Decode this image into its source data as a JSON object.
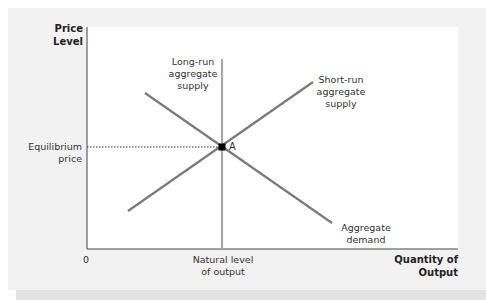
{
  "axes": {
    "y_label_line1": "Price",
    "y_label_line2": "Level",
    "x_label_line1": "Quantity of",
    "x_label_line2": "Output",
    "origin": "0"
  },
  "curves": {
    "lras_line1": "Long-run",
    "lras_line2": "aggregate",
    "lras_line3": "supply",
    "sras_line1": "Short-run",
    "sras_line2": "aggregate",
    "sras_line3": "supply",
    "ad_line1": "Aggregate",
    "ad_line2": "demand"
  },
  "annotations": {
    "equilibrium_line1": "Equilibrium",
    "equilibrium_line2": "price",
    "natural_line1": "Natural level",
    "natural_line2": "of output",
    "point_label": "A"
  },
  "colors": {
    "curve": "#7a7a7a",
    "lras": "#a8a8a8",
    "axis": "#444444",
    "panel": "#f2f2f2",
    "point": "#000000"
  }
}
